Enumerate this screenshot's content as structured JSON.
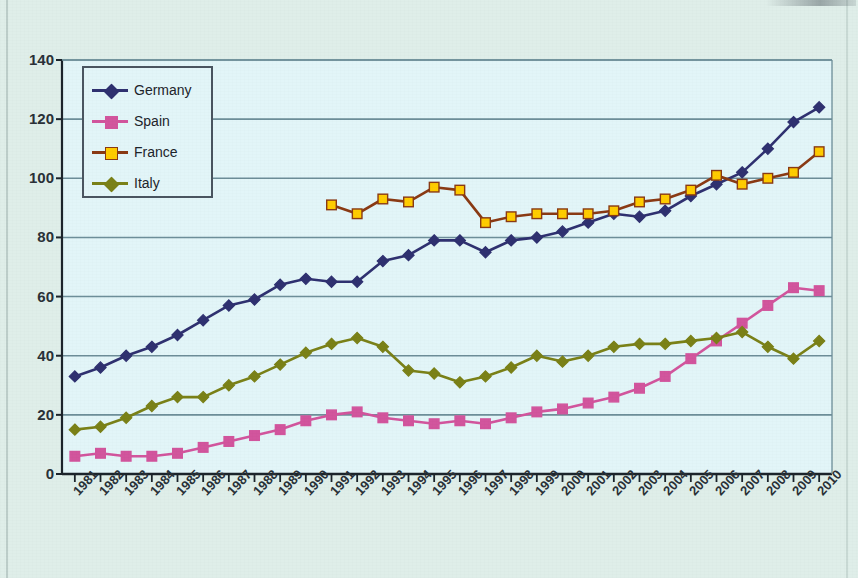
{
  "title": "",
  "legend": {
    "position": "inside-top-left",
    "items": [
      {
        "label": "Germany",
        "color": "#2f3170",
        "marker": "diamond"
      },
      {
        "label": "Spain",
        "color": "#d2559d",
        "marker": "square"
      },
      {
        "label": "France",
        "color": "#8a3a14",
        "marker": "square",
        "marker_fill": "#ffcc00"
      },
      {
        "label": "Italy",
        "color": "#7a8118",
        "marker": "diamond"
      }
    ]
  },
  "axes": {
    "y_ticks": [
      0,
      20,
      40,
      60,
      80,
      100,
      120,
      140
    ],
    "y_min": 0,
    "y_max": 140,
    "x_label_rotation": -47
  },
  "colors": {
    "page_background": "#dfeee9",
    "plot_background": "#e2f5f8",
    "axis": "#1c242b",
    "gridline": "#6d8e99",
    "germany": "#2f3170",
    "spain": "#d2559d",
    "france_line": "#8a3a14",
    "france_marker": "#ffcc00",
    "italy": "#7a8118"
  },
  "chart_data": {
    "type": "line",
    "title": "",
    "xlabel": "",
    "ylabel": "",
    "ylim": [
      0,
      140
    ],
    "grid": true,
    "legend_position": "top-left inside plot",
    "categories": [
      "1981",
      "1982",
      "1983",
      "1984",
      "1985",
      "1986",
      "1987",
      "1988",
      "1989",
      "1990",
      "1991",
      "1992",
      "1993",
      "1994",
      "1995",
      "1996",
      "1997",
      "1998",
      "1999",
      "2000",
      "2001",
      "2002",
      "2003",
      "2004",
      "2005",
      "2006",
      "2007",
      "2008",
      "2009",
      "2010"
    ],
    "series": [
      {
        "name": "Germany",
        "color": "#2f3170",
        "marker": "diamond",
        "values": [
          33,
          36,
          40,
          43,
          47,
          52,
          57,
          59,
          64,
          66,
          65,
          65,
          72,
          74,
          79,
          79,
          75,
          79,
          80,
          82,
          85,
          88,
          87,
          89,
          94,
          98,
          102,
          110,
          119,
          124
        ]
      },
      {
        "name": "Spain",
        "color": "#d2559d",
        "marker": "square",
        "values": [
          6,
          7,
          6,
          6,
          7,
          9,
          11,
          13,
          15,
          18,
          20,
          21,
          19,
          18,
          17,
          18,
          17,
          19,
          21,
          22,
          24,
          26,
          29,
          33,
          39,
          45,
          51,
          57,
          63,
          62
        ]
      },
      {
        "name": "France",
        "color": "#8a3a14",
        "marker_fill": "#ffcc00",
        "marker": "square",
        "start_index": 10,
        "values": [
          null,
          null,
          null,
          null,
          null,
          null,
          null,
          null,
          null,
          null,
          91,
          88,
          93,
          92,
          97,
          96,
          85,
          87,
          88,
          88,
          88,
          89,
          92,
          93,
          96,
          101,
          98,
          100,
          102,
          109
        ]
      },
      {
        "name": "Italy",
        "color": "#7a8118",
        "marker": "diamond",
        "values": [
          15,
          16,
          19,
          23,
          26,
          26,
          30,
          33,
          37,
          41,
          44,
          46,
          43,
          35,
          34,
          31,
          33,
          36,
          40,
          38,
          40,
          43,
          44,
          44,
          45,
          46,
          48,
          43,
          39,
          45
        ]
      }
    ]
  }
}
